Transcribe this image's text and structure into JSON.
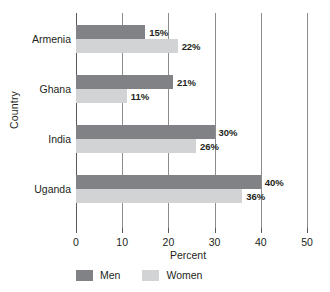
{
  "chart_data": {
    "type": "bar",
    "orientation": "horizontal",
    "title": "",
    "xlabel": "Percent",
    "ylabel": "Country",
    "categories": [
      "Armenia",
      "Ghana",
      "India",
      "Uganda"
    ],
    "series": [
      {
        "name": "Men",
        "color": "#808285",
        "values": [
          15,
          21,
          30,
          40
        ],
        "labels": [
          "15%",
          "21%",
          "30%",
          "40%"
        ]
      },
      {
        "name": "Women",
        "color": "#d1d3d4",
        "values": [
          22,
          11,
          26,
          36
        ],
        "labels": [
          "22%",
          "11%",
          "26%",
          "36%"
        ]
      }
    ],
    "xlim": [
      0,
      50
    ],
    "xticks": [
      0,
      10,
      20,
      30,
      40,
      50
    ],
    "xtick_labels": [
      "0",
      "10",
      "20",
      "30",
      "40",
      "50"
    ],
    "grid": "vertical",
    "legend_position": "bottom-left"
  },
  "axes": {
    "y_title": "Country",
    "x_title": "Percent"
  },
  "legend": {
    "items": [
      {
        "label": "Men",
        "swatch": "men"
      },
      {
        "label": "Women",
        "swatch": "women"
      }
    ]
  }
}
